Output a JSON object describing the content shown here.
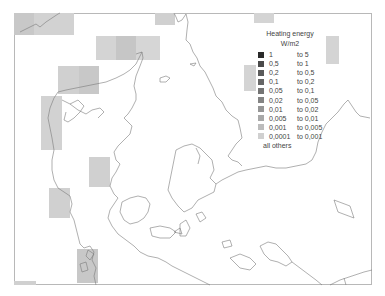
{
  "map": {
    "region": "Denmark and surrounding seas",
    "frame": {
      "border_color": "#b8b8b8"
    },
    "grid_cells": [
      {
        "x": 14,
        "y": 13,
        "w": 20,
        "h": 22,
        "color": "#c8c8c8"
      },
      {
        "x": 34,
        "y": 13,
        "w": 40,
        "h": 22,
        "color": "#d2d2d2"
      },
      {
        "x": 96,
        "y": 36,
        "w": 20,
        "h": 24,
        "color": "#d4d4d4"
      },
      {
        "x": 116,
        "y": 36,
        "w": 20,
        "h": 24,
        "color": "#c6c6c6"
      },
      {
        "x": 136,
        "y": 36,
        "w": 24,
        "h": 24,
        "color": "#d6d6d6"
      },
      {
        "x": 58,
        "y": 66,
        "w": 21,
        "h": 28,
        "color": "#d0d0d0"
      },
      {
        "x": 79,
        "y": 66,
        "w": 20,
        "h": 28,
        "color": "#c8c8c8"
      },
      {
        "x": 41,
        "y": 96,
        "w": 21,
        "h": 54,
        "color": "#d2d2d2"
      },
      {
        "x": 155,
        "y": 13,
        "w": 20,
        "h": 12,
        "color": "#d0d0d0"
      },
      {
        "x": 254,
        "y": 13,
        "w": 20,
        "h": 10,
        "color": "#d4d4d4"
      },
      {
        "x": 326,
        "y": 36,
        "w": 13,
        "h": 28,
        "color": "#d4d4d4"
      },
      {
        "x": 244,
        "y": 65,
        "w": 12,
        "h": 26,
        "color": "#d4d4d4"
      },
      {
        "x": 89,
        "y": 157,
        "w": 21,
        "h": 30,
        "color": "#d0d0d0"
      },
      {
        "x": 49,
        "y": 188,
        "w": 21,
        "h": 30,
        "color": "#d0d0d0"
      },
      {
        "x": 77,
        "y": 249,
        "w": 21,
        "h": 34,
        "color": "#c8c8c8"
      },
      {
        "x": 14,
        "y": 281,
        "w": 22,
        "h": 4,
        "color": "#d0d0d0"
      }
    ],
    "coastline_color": "#7a7a7a"
  },
  "legend": {
    "title": "Heating energy",
    "unit": "W/m2",
    "entries": [
      {
        "lo": "1",
        "hi": "to 5",
        "color": "#2a2a2a"
      },
      {
        "lo": "0,5",
        "hi": "to 1",
        "color": "#4a4a4a"
      },
      {
        "lo": "0,2",
        "hi": "to 0,5",
        "color": "#5a5a5a"
      },
      {
        "lo": "0,1",
        "hi": "to 0,2",
        "color": "#666666"
      },
      {
        "lo": "0,05",
        "hi": "to 0,1",
        "color": "#747474"
      },
      {
        "lo": "0,02",
        "hi": "to 0,05",
        "color": "#848484"
      },
      {
        "lo": "0,01",
        "hi": "to 0,02",
        "color": "#969696"
      },
      {
        "lo": "0,005",
        "hi": "to 0,01",
        "color": "#a8a8a8"
      },
      {
        "lo": "0,001",
        "hi": "to 0,005",
        "color": "#bcbcbc"
      },
      {
        "lo": "0,0001",
        "hi": "to 0,001",
        "color": "#d0d0d0"
      }
    ],
    "others_label": "all others"
  }
}
